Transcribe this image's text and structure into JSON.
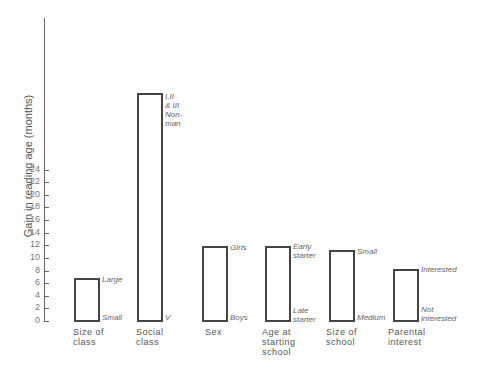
{
  "chart_data": {
    "type": "bar",
    "title": "",
    "xlabel": "",
    "ylabel": "Gain in reading age (months)",
    "ylim": [
      0,
      24
    ],
    "yticks": [
      0,
      2,
      4,
      6,
      8,
      10,
      12,
      14,
      16,
      18,
      20,
      22,
      24
    ],
    "grid": false,
    "categories": [
      "Size of class",
      "Social class",
      "Sex",
      "Age at starting school",
      "Size of school",
      "Parental interest"
    ],
    "values": [
      3.4,
      18,
      5.9,
      5.9,
      5.6,
      4.1
    ],
    "bar_annotations": [
      {
        "top": "Large",
        "bottom": "Small"
      },
      {
        "top": "I, II & III Non-man",
        "bottom": "V"
      },
      {
        "top": "Girls",
        "bottom": "Boys"
      },
      {
        "top": "Early starter",
        "bottom": "Late starter"
      },
      {
        "top": "Small",
        "bottom": "Medium"
      },
      {
        "top": "Interested",
        "bottom": "Not interested"
      }
    ]
  },
  "labels": {
    "ylabel": "Gain in reading age (months)",
    "ticks": [
      "0",
      "2",
      "4",
      "6",
      "8",
      "10",
      "12",
      "14",
      "16",
      "18",
      "20",
      "22",
      "24"
    ],
    "cat1": [
      "Size of",
      "class"
    ],
    "cat2": [
      "Social",
      "class"
    ],
    "cat3": [
      "Sex"
    ],
    "cat4": [
      "Age at",
      "starting",
      "school"
    ],
    "cat5": [
      "Size of",
      "school"
    ],
    "cat6": [
      "Parental",
      "interest"
    ],
    "ann1_top": "Large",
    "ann1_bot": "Small",
    "ann2_top": [
      "I,II",
      "& III",
      "Non-",
      "man"
    ],
    "ann2_bot": "V",
    "ann3_top": "Girls",
    "ann3_bot": "Boys",
    "ann4_top": [
      "Early",
      "starter"
    ],
    "ann4_bot": [
      "Late",
      "starter"
    ],
    "ann5_top": "Small",
    "ann5_bot": "Medium",
    "ann6_top": "Interested",
    "ann6_bot": [
      "Not",
      "interested"
    ]
  }
}
